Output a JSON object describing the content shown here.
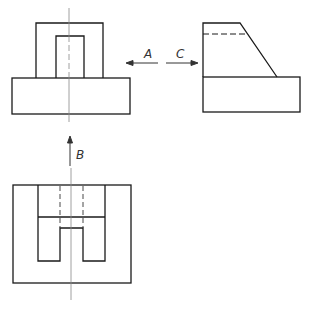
{
  "labels": {
    "a": "A",
    "b": "B",
    "c": "C"
  },
  "views": {
    "front": "front-view",
    "side": "side-view",
    "bottom": "bottom-view"
  },
  "colors": {
    "line": "#1a1a1a",
    "centerline": "#888888",
    "background": "#ffffff"
  }
}
